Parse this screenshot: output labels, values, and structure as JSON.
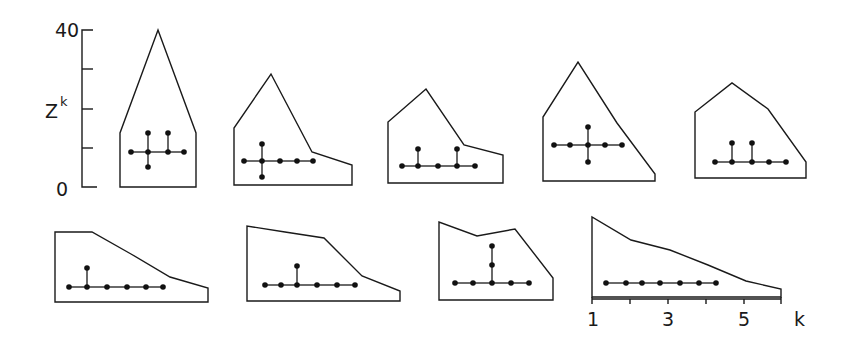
{
  "chart_data": {
    "type": "area",
    "title": "",
    "ylabel": "Z",
    "ylabel_superscript": "k",
    "xlabel": "k",
    "y_ticks": [
      "40",
      "0"
    ],
    "y_tick_count": 5,
    "ylim": [
      0,
      40
    ],
    "x_ticks": [
      "1",
      "3",
      "5"
    ],
    "x_tick_count": 6,
    "xlim": [
      1,
      6
    ],
    "colors": {
      "ink": "#1a1a1a",
      "background": "#ffffff"
    },
    "panels": [
      {
        "id": 1,
        "profile_k": [
          1,
          3.5,
          6
        ],
        "profile_z": [
          14,
          40,
          14
        ],
        "outline": [
          [
            120,
            187
          ],
          [
            120,
            133
          ],
          [
            158,
            30
          ],
          [
            196,
            133
          ],
          [
            196,
            187
          ]
        ],
        "tree_nodes": [
          [
            131,
            152
          ],
          [
            148,
            152
          ],
          [
            168,
            152
          ],
          [
            184,
            152
          ],
          [
            148,
            133
          ],
          [
            168,
            133
          ],
          [
            148,
            167
          ]
        ],
        "tree_edges": [
          [
            0,
            1
          ],
          [
            1,
            2
          ],
          [
            2,
            3
          ],
          [
            1,
            4
          ],
          [
            2,
            5
          ],
          [
            1,
            6
          ]
        ]
      },
      {
        "id": 2,
        "profile_k": [
          1,
          2,
          3,
          4,
          5,
          6
        ],
        "profile_z": [
          15,
          28,
          20,
          9,
          6,
          5
        ],
        "outline": [
          [
            234,
            185
          ],
          [
            234,
            128
          ],
          [
            271,
            74
          ],
          [
            312,
            152
          ],
          [
            352,
            165
          ],
          [
            352,
            185
          ]
        ],
        "tree_nodes": [
          [
            244,
            161
          ],
          [
            262,
            161
          ],
          [
            280,
            161
          ],
          [
            297,
            161
          ],
          [
            313,
            161
          ],
          [
            262,
            144
          ],
          [
            262,
            177
          ]
        ],
        "tree_edges": [
          [
            0,
            1
          ],
          [
            1,
            2
          ],
          [
            2,
            3
          ],
          [
            3,
            4
          ],
          [
            1,
            5
          ],
          [
            1,
            6
          ]
        ]
      },
      {
        "id": 3,
        "profile_k": [
          1,
          2,
          3,
          4,
          5,
          6
        ],
        "profile_z": [
          15,
          24,
          17,
          10,
          7,
          7
        ],
        "outline": [
          [
            388,
            183
          ],
          [
            388,
            122
          ],
          [
            426,
            89
          ],
          [
            464,
            145
          ],
          [
            503,
            155
          ],
          [
            503,
            183
          ]
        ],
        "tree_nodes": [
          [
            402,
            166
          ],
          [
            418,
            166
          ],
          [
            438,
            166
          ],
          [
            457,
            166
          ],
          [
            475,
            166
          ],
          [
            418,
            149
          ],
          [
            457,
            149
          ]
        ],
        "tree_edges": [
          [
            0,
            1
          ],
          [
            1,
            2
          ],
          [
            2,
            3
          ],
          [
            3,
            4
          ],
          [
            1,
            5
          ],
          [
            3,
            6
          ]
        ]
      },
      {
        "id": 4,
        "profile_k": [
          1,
          2,
          3,
          4,
          5,
          6
        ],
        "profile_z": [
          16,
          30,
          25,
          15,
          5,
          2
        ],
        "outline": [
          [
            543,
            181
          ],
          [
            543,
            117
          ],
          [
            578,
            62
          ],
          [
            617,
            123
          ],
          [
            655,
            174
          ],
          [
            655,
            181
          ]
        ],
        "tree_nodes": [
          [
            554,
            145
          ],
          [
            570,
            145
          ],
          [
            588,
            145
          ],
          [
            605,
            145
          ],
          [
            622,
            145
          ],
          [
            588,
            127
          ],
          [
            588,
            162
          ]
        ],
        "tree_edges": [
          [
            0,
            1
          ],
          [
            1,
            2
          ],
          [
            2,
            3
          ],
          [
            3,
            4
          ],
          [
            2,
            5
          ],
          [
            2,
            6
          ]
        ]
      },
      {
        "id": 5,
        "profile_k": [
          1,
          2,
          3,
          4,
          5,
          6
        ],
        "profile_z": [
          17,
          24,
          17,
          11,
          5,
          4
        ],
        "outline": [
          [
            695,
            178
          ],
          [
            695,
            112
          ],
          [
            732,
            83
          ],
          [
            768,
            109
          ],
          [
            806,
            162
          ],
          [
            806,
            178
          ]
        ],
        "tree_nodes": [
          [
            715,
            162
          ],
          [
            732,
            162
          ],
          [
            752,
            162
          ],
          [
            769,
            162
          ],
          [
            786,
            162
          ],
          [
            732,
            143
          ],
          [
            752,
            143
          ]
        ],
        "tree_edges": [
          [
            0,
            1
          ],
          [
            1,
            2
          ],
          [
            2,
            3
          ],
          [
            3,
            4
          ],
          [
            1,
            5
          ],
          [
            2,
            6
          ]
        ]
      },
      {
        "id": 6,
        "profile_k": [
          1,
          2,
          3,
          4,
          5,
          6
        ],
        "profile_z": [
          18,
          18,
          15,
          11,
          6,
          4
        ],
        "outline": [
          [
            55,
            302
          ],
          [
            55,
            232
          ],
          [
            92,
            232
          ],
          [
            131,
            254
          ],
          [
            170,
            277
          ],
          [
            208,
            288
          ],
          [
            208,
            302
          ]
        ],
        "tree_nodes": [
          [
            69,
            287
          ],
          [
            87,
            287
          ],
          [
            107,
            287
          ],
          [
            127,
            287
          ],
          [
            146,
            287
          ],
          [
            163,
            287
          ],
          [
            87,
            268
          ]
        ],
        "tree_edges": [
          [
            0,
            1
          ],
          [
            1,
            2
          ],
          [
            2,
            3
          ],
          [
            3,
            4
          ],
          [
            4,
            5
          ],
          [
            1,
            6
          ]
        ]
      },
      {
        "id": 7,
        "profile_k": [
          1,
          2,
          3,
          4,
          5,
          6
        ],
        "profile_z": [
          19,
          18,
          16,
          16,
          6,
          3
        ],
        "outline": [
          [
            247,
            301
          ],
          [
            247,
            226
          ],
          [
            285,
            232
          ],
          [
            324,
            238
          ],
          [
            362,
            276
          ],
          [
            400,
            291
          ],
          [
            400,
            301
          ]
        ],
        "tree_nodes": [
          [
            265,
            285
          ],
          [
            281,
            285
          ],
          [
            297,
            285
          ],
          [
            317,
            285
          ],
          [
            337,
            285
          ],
          [
            355,
            285
          ],
          [
            297,
            266
          ]
        ],
        "tree_edges": [
          [
            0,
            1
          ],
          [
            1,
            2
          ],
          [
            2,
            3
          ],
          [
            3,
            4
          ],
          [
            4,
            5
          ],
          [
            2,
            6
          ]
        ]
      },
      {
        "id": 8,
        "profile_k": [
          1,
          2,
          3,
          4,
          5
        ],
        "profile_z": [
          20,
          16,
          18,
          12,
          6
        ],
        "outline": [
          [
            439,
            300
          ],
          [
            439,
            222
          ],
          [
            477,
            236
          ],
          [
            515,
            229
          ],
          [
            553,
            278
          ],
          [
            553,
            300
          ]
        ],
        "tree_nodes": [
          [
            455,
            283
          ],
          [
            473,
            283
          ],
          [
            492,
            283
          ],
          [
            511,
            283
          ],
          [
            529,
            283
          ],
          [
            492,
            265
          ],
          [
            492,
            246
          ]
        ],
        "tree_edges": [
          [
            0,
            1
          ],
          [
            1,
            2
          ],
          [
            2,
            3
          ],
          [
            3,
            4
          ],
          [
            2,
            5
          ],
          [
            5,
            6
          ]
        ]
      },
      {
        "id": 9,
        "profile_k": [
          1,
          2,
          3,
          4,
          5,
          6
        ],
        "profile_z": [
          20,
          15,
          12,
          8,
          4,
          2
        ],
        "outline": [
          [
            592,
            297
          ],
          [
            592,
            217
          ],
          [
            631,
            240
          ],
          [
            670,
            250
          ],
          [
            708,
            265
          ],
          [
            746,
            281
          ],
          [
            781,
            289
          ],
          [
            781,
            297
          ]
        ],
        "tree_nodes": [
          [
            606,
            283
          ],
          [
            626,
            283
          ],
          [
            642,
            283
          ],
          [
            660,
            283
          ],
          [
            680,
            283
          ],
          [
            699,
            283
          ],
          [
            716,
            283
          ]
        ],
        "tree_edges": [
          [
            0,
            1
          ],
          [
            1,
            2
          ],
          [
            2,
            3
          ],
          [
            3,
            4
          ],
          [
            4,
            5
          ],
          [
            5,
            6
          ]
        ]
      }
    ]
  },
  "axis_labels": {
    "y_top": "40",
    "y_bottom": "0",
    "y_name": "Z",
    "y_name_sup": "k",
    "x_1": "1",
    "x_3": "3",
    "x_5": "5",
    "x_name": "k"
  }
}
